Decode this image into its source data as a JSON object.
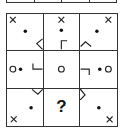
{
  "puzzle": {
    "type": "3x3 matrix reasoning puzzle",
    "stroke_color": "#222222",
    "cells": [
      {
        "row": 1,
        "col": 1,
        "elements": [
          "cross-top-left",
          "dot-center",
          "chevron-left-bottom-right"
        ]
      },
      {
        "row": 1,
        "col": 2,
        "elements": [
          "cross-top-center",
          "dot-center",
          "corner-bracket-bottom-center"
        ]
      },
      {
        "row": 1,
        "col": 3,
        "elements": [
          "cross-top-right",
          "dot-center",
          "chevron-up-bottom-left"
        ]
      },
      {
        "row": 2,
        "col": 1,
        "elements": [
          "circle-left",
          "dot-center-left",
          "corner-bracket-right"
        ]
      },
      {
        "row": 2,
        "col": 2,
        "elements": [
          "circle-center"
        ]
      },
      {
        "row": 2,
        "col": 3,
        "elements": [
          "corner-bracket-left",
          "dot-center-right",
          "circle-right"
        ]
      },
      {
        "row": 3,
        "col": 1,
        "elements": [
          "chevron-down-top-right",
          "dot-center",
          "cross-bottom-left"
        ]
      },
      {
        "row": 3,
        "col": 2,
        "elements": [
          "question-mark"
        ],
        "text": "?"
      },
      {
        "row": 3,
        "col": 3,
        "elements": [
          "chevron-right-top-left",
          "dot-center",
          "cross-bottom-right"
        ]
      }
    ],
    "missing_label": "?"
  }
}
